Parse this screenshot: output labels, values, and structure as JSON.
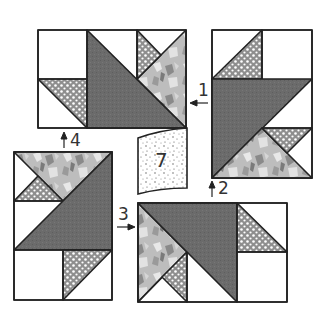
{
  "diagram": {
    "colors": {
      "outline": "#222222",
      "dark": "#6a6a6a",
      "dotted_bg": "#9a9a9a",
      "dotted_dot": "#ffffff",
      "floral_base": "#bdbdbd",
      "floral_dark": "#7a7a7a",
      "floral_light": "#e6e6e6",
      "white": "#ffffff",
      "speckle_bg": "#ffffff",
      "speckle_dot": "#555555"
    },
    "blocks": [
      {
        "id": "block-top-left",
        "position": "top-left",
        "arrow_label": "4",
        "arrow_direction": "up"
      },
      {
        "id": "block-top-right",
        "position": "top-right",
        "arrow_label": "1",
        "arrow_direction": "left"
      },
      {
        "id": "block-bottom-left",
        "position": "bottom-left",
        "arrow_label": "3",
        "arrow_direction": "right"
      },
      {
        "id": "block-bottom-right",
        "position": "bottom-right",
        "arrow_label": "2",
        "arrow_direction": "up"
      }
    ],
    "center_piece": {
      "label": "7",
      "fabric": "speckled"
    },
    "step_labels": {
      "step1": "1",
      "step2": "2",
      "step3": "3",
      "step4": "4",
      "center": "7"
    }
  }
}
